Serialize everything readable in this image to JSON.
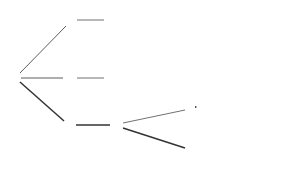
{
  "legend": {
    "nature_label": "natures choices",
    "agent_label": "agent choices"
  },
  "nodes": {
    "root": {
      "value": "4557"
    },
    "top_leaf": {
      "value": "6776"
    },
    "mid_leaf": {
      "value": "8421"
    },
    "turn_agent": {
      "value": "4149"
    },
    "me_high": {
      "value": "4149"
    },
    "me_low": {
      "value": "4149"
    },
    "me_goal": {
      "value": "10000"
    },
    "tm_high": {
      "value": "4149"
    },
    "tm_low": {
      "value": "4149"
    },
    "tm_goal": {
      "value": "10000"
    }
  },
  "edges": {
    "move_kick_top": {
      "action": "move_kick",
      "cost": "cost: -70"
    },
    "kick": {
      "action": "kick",
      "cost": "cost: -70"
    },
    "turn": {
      "action": "turn"
    },
    "intercept_me": {
      "action": "intercept(me)",
      "cost": "cost: -7"
    },
    "intercept_tm": {
      "action": "intercept(TM)",
      "cost": "cost: -12"
    },
    "me_p_high": {
      "prob": "0.8"
    },
    "me_p_low": {
      "prob": "0.2"
    },
    "tm_p_high": {
      "prob": "0.8"
    },
    "tm_p_low": {
      "prob": "0.2"
    },
    "me_move_kick": {
      "action": "move_kick",
      "cost": "cost: -70"
    },
    "tm_move_kick": {
      "action": "move_kick",
      "cost": "cost: -70"
    }
  }
}
